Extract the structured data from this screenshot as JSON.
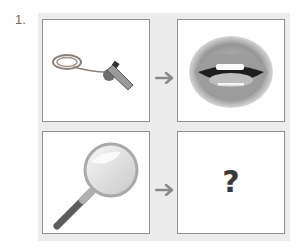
{
  "question": {
    "number": "1.",
    "panels": [
      {
        "name": "whistle",
        "description": "whistle-image"
      },
      {
        "name": "mouth",
        "description": "open-mouth-image"
      },
      {
        "name": "magnifier",
        "description": "magnifying-glass-image"
      },
      {
        "name": "unknown",
        "label": "?"
      }
    ],
    "arrows": [
      "arrow-right-icon",
      "arrow-right-icon"
    ],
    "colors": {
      "frame": "#ececec",
      "border": "#8f8f8f",
      "arrow": "#8a8a8a"
    }
  }
}
